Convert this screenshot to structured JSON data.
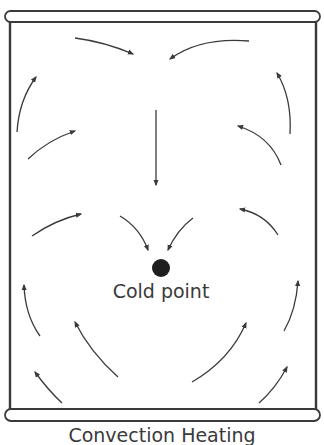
{
  "diagram": {
    "title": "Convection Heating",
    "cold_point_label": "Cold point",
    "colors": {
      "stroke": "#3a3a3a",
      "background": "#ffffff",
      "dot": "#1e1e1e"
    },
    "container": {
      "shape": "can cross-section",
      "top_rim": "rounded bar",
      "bottom_rim": "rounded bar"
    },
    "arrows": [
      {
        "id": "top-left",
        "direction": "right-down toward center"
      },
      {
        "id": "top-right",
        "direction": "left-down toward center"
      },
      {
        "id": "left-upper",
        "direction": "up"
      },
      {
        "id": "right-upper",
        "direction": "up"
      },
      {
        "id": "left-mid",
        "direction": "up-right"
      },
      {
        "id": "right-mid",
        "direction": "up-left"
      },
      {
        "id": "center",
        "direction": "down"
      },
      {
        "id": "left-lower",
        "direction": "up-right"
      },
      {
        "id": "right-lower",
        "direction": "up-left"
      },
      {
        "id": "inner-left",
        "direction": "down toward cold point"
      },
      {
        "id": "inner-right",
        "direction": "down toward cold point"
      },
      {
        "id": "bottom-left-wall",
        "direction": "up"
      },
      {
        "id": "bottom-right-wall",
        "direction": "up"
      },
      {
        "id": "bottom-left-inner",
        "direction": "up-left"
      },
      {
        "id": "bottom-right-inner",
        "direction": "up-right"
      },
      {
        "id": "bottom-left-corner",
        "direction": "up-left"
      },
      {
        "id": "bottom-right-corner",
        "direction": "up-right"
      }
    ]
  }
}
